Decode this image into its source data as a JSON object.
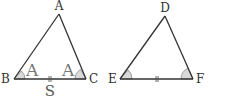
{
  "diagram": {
    "colors": {
      "stroke": "#333333",
      "angle_fill": "#d9d9d9",
      "angle_label": "#777777"
    },
    "triangle_abc": {
      "vertices": {
        "A": "A",
        "B": "B",
        "C": "C"
      },
      "angle_labels": {
        "at_B": "A",
        "at_C": "A"
      },
      "side_label": "S"
    },
    "triangle_def": {
      "vertices": {
        "D": "D",
        "E": "E",
        "F": "F"
      }
    }
  }
}
